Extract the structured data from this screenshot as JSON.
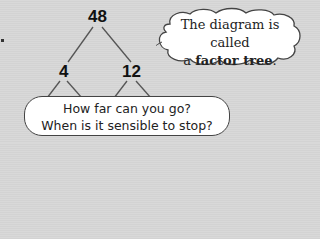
{
  "tree": {
    "root": "48",
    "children": [
      "4",
      "12"
    ]
  },
  "cloud_callout": {
    "line1": "The diagram is called",
    "line2_prefix": "a ",
    "line2_bold": "factor tree",
    "line2_suffix": "."
  },
  "speech_bubble": {
    "line1": "How far can you go?",
    "line2": "When is it sensible to stop?"
  }
}
